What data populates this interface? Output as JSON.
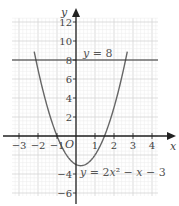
{
  "chart_data": {
    "type": "line",
    "title": "",
    "xlabel": "x",
    "ylabel": "y",
    "origin_label": "O",
    "xlim": [
      -3.5,
      4.3
    ],
    "ylim": [
      -7,
      14
    ],
    "grid": true,
    "x_ticks": [
      -3,
      -2,
      -1,
      1,
      2,
      3,
      4
    ],
    "x_tick_labels": [
      "−3",
      "−2",
      "−1",
      "1",
      "2",
      "3",
      "4"
    ],
    "y_ticks": [
      12,
      10,
      8,
      6,
      4,
      2,
      -4,
      -6
    ],
    "y_tick_labels": [
      "12",
      "10",
      "8",
      "6",
      "4",
      "2",
      "−4",
      "−6"
    ],
    "series": [
      {
        "name": "y = 2x² − x − 3",
        "kind": "curve",
        "equation": {
          "a": 2,
          "b": -1,
          "c": -3
        },
        "x_range": [
          -2.2,
          2.7
        ]
      },
      {
        "name": "y = 8",
        "kind": "horizontal-line",
        "y": 8
      }
    ],
    "annotations": [
      {
        "id": "line",
        "parts": [
          [
            "y",
            true
          ],
          [
            " = 8",
            false
          ]
        ]
      },
      {
        "id": "curve",
        "parts": [
          [
            "y",
            true
          ],
          [
            " = 2",
            false
          ],
          [
            "x",
            true
          ],
          [
            "²",
            false
          ],
          [
            " − ",
            false
          ],
          [
            "x",
            true
          ],
          [
            " − 3",
            false
          ]
        ]
      }
    ]
  }
}
